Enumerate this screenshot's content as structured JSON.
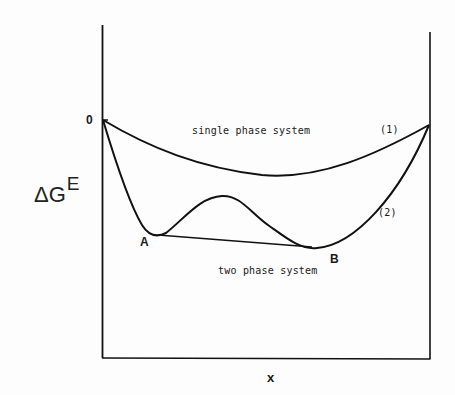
{
  "figure": {
    "type": "excess Gibbs energy vs composition diagram",
    "y_axis_label": "ΔG",
    "y_axis_superscript": "E",
    "x_axis_label": "x",
    "origin_label": "0",
    "curves": [
      {
        "id": "1",
        "label": "(1)",
        "description": "single phase curve"
      },
      {
        "id": "2",
        "label": "(2)",
        "description": "two-minima curve with common tangent"
      }
    ],
    "regions": {
      "single_phase": "single phase system",
      "two_phase": "two phase system"
    },
    "points": {
      "a": "A",
      "b": "B"
    },
    "colors": {
      "line": "#111111",
      "background": "#fdfdfd"
    }
  }
}
